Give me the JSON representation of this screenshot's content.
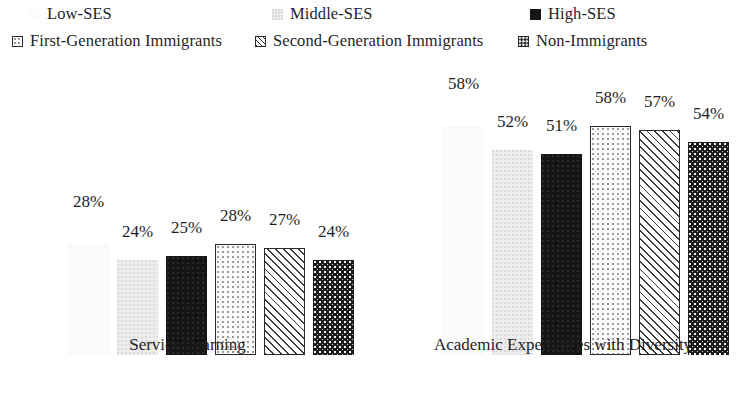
{
  "legend": {
    "items": [
      {
        "label": "Low-SES",
        "pattern": "faint-noise",
        "swatch_class": "fill-low"
      },
      {
        "label": "Middle-SES",
        "pattern": "light-gray-speckle",
        "swatch_class": "fill-mid"
      },
      {
        "label": "High-SES",
        "pattern": "solid-black",
        "swatch_class": "fill-high"
      },
      {
        "label": "First-Generation Immigrants",
        "pattern": "white-dotted",
        "swatch_class": "fill-first"
      },
      {
        "label": "Second-Generation Immigrants",
        "pattern": "diagonal-hatch",
        "swatch_class": "fill-second"
      },
      {
        "label": "Non-Immigrants",
        "pattern": "dark-checkered",
        "swatch_class": "fill-non"
      }
    ]
  },
  "chart_data": {
    "type": "bar",
    "title": "",
    "xlabel": "",
    "ylabel": "",
    "ylim": [
      0,
      70
    ],
    "grid": false,
    "legend_position": "top",
    "categories": [
      "Service Learning",
      "Academic Experiences with Diversity"
    ],
    "series": [
      {
        "name": "Low-SES",
        "values": [
          28,
          58
        ],
        "labels": [
          "28%",
          "58%"
        ]
      },
      {
        "name": "Middle-SES",
        "values": [
          24,
          52
        ],
        "labels": [
          "24%",
          "52%"
        ]
      },
      {
        "name": "High-SES",
        "values": [
          25,
          51
        ],
        "labels": [
          "25%",
          "51%"
        ]
      },
      {
        "name": "First-Generation Immigrants",
        "values": [
          28,
          58
        ],
        "labels": [
          "28%",
          "58%"
        ]
      },
      {
        "name": "Second-Generation Immigrants",
        "values": [
          27,
          57
        ],
        "labels": [
          "27%",
          "57%"
        ]
      },
      {
        "name": "Non-Immigrants",
        "values": [
          24,
          54
        ],
        "labels": [
          "24%",
          "54%"
        ]
      }
    ]
  },
  "groups": [
    {
      "label": "Service Learning",
      "bars": [
        {
          "series": "Low-SES",
          "value": 28,
          "label": "28%",
          "fill": "fill-low"
        },
        {
          "series": "Middle-SES",
          "value": 24,
          "label": "24%",
          "fill": "fill-mid"
        },
        {
          "series": "High-SES",
          "value": 25,
          "label": "25%",
          "fill": "fill-high"
        },
        {
          "series": "First-Generation Immigrants",
          "value": 28,
          "label": "28%",
          "fill": "fill-first"
        },
        {
          "series": "Second-Generation Immigrants",
          "value": 27,
          "label": "27%",
          "fill": "fill-second"
        },
        {
          "series": "Non-Immigrants",
          "value": 24,
          "label": "24%",
          "fill": "fill-non"
        }
      ]
    },
    {
      "label": "Academic Experiences with Diversity",
      "bars": [
        {
          "series": "Low-SES",
          "value": 58,
          "label": "58%",
          "fill": "fill-low"
        },
        {
          "series": "Middle-SES",
          "value": 52,
          "label": "52%",
          "fill": "fill-mid"
        },
        {
          "series": "High-SES",
          "value": 51,
          "label": "51%",
          "fill": "fill-high"
        },
        {
          "series": "First-Generation Immigrants",
          "value": 58,
          "label": "58%",
          "fill": "fill-first"
        },
        {
          "series": "Second-Generation Immigrants",
          "value": 57,
          "label": "57%",
          "fill": "fill-second"
        },
        {
          "series": "Non-Immigrants",
          "value": 54,
          "label": "54%",
          "fill": "fill-non"
        }
      ]
    }
  ],
  "layout": {
    "bar_width": 41,
    "bar_gap": 8,
    "group_left_pad": 58,
    "value_label_offset": 20,
    "scale_px_per_unit": 3.95
  }
}
